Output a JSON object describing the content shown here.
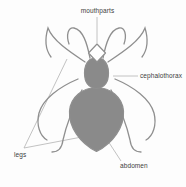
{
  "diagram": {
    "labels": {
      "mouthparts": "mouthparts",
      "cephalothorax": "cephalothorax",
      "legs": "legs",
      "abdomen": "abdomen"
    },
    "colors": {
      "body_fill": "#8a8a8a",
      "outline": "#8f8f8f",
      "mouthparts_fill": "#ffffff",
      "leader_line": "#b3b3b3",
      "label_text": "#3d3d3d",
      "background": "#fdfdfd"
    }
  }
}
